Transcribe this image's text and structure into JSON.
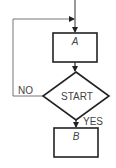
{
  "diagram": {
    "type": "flowchart",
    "nodes": {
      "box_a": {
        "label": "A",
        "shape": "rectangle"
      },
      "decision": {
        "label": "START",
        "shape": "diamond"
      },
      "box_b": {
        "label": "B",
        "shape": "rectangle"
      }
    },
    "edges": {
      "no_label": "NO",
      "yes_label": "YES"
    },
    "colors": {
      "stroke": "#222222",
      "thin_stroke": "#777777",
      "text": "#444444",
      "background": "#ffffff"
    }
  }
}
